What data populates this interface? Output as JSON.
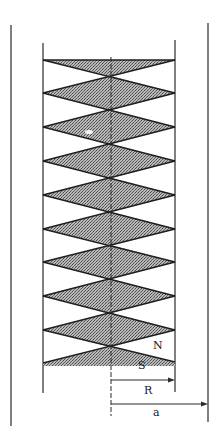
{
  "diagram": {
    "labels": {
      "north": "N",
      "south": "S",
      "inner_radius": "R",
      "outer_radius": "a"
    },
    "colors": {
      "line": "#2a2a2a",
      "shade": "#9a9a9a",
      "background": "#ffffff"
    },
    "geometry": {
      "outer_left_x": 11,
      "outer_right_x": 208,
      "inner_left_x": 43,
      "inner_right_x": 175,
      "center_x": 111,
      "zigzag_side_y": [
        60,
        93,
        127,
        161,
        195,
        229,
        262,
        296,
        330,
        363
      ],
      "center_crossings_y": [
        76,
        110,
        144,
        178,
        212,
        245,
        279,
        313,
        347
      ],
      "diamond_count": 8
    }
  }
}
